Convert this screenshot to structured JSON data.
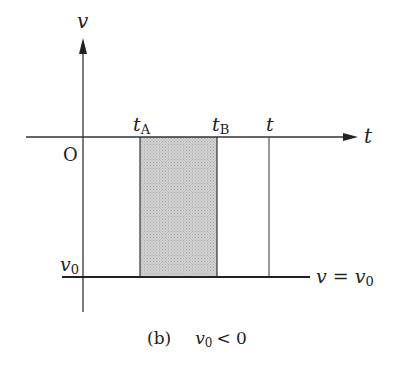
{
  "diagram": {
    "axis_labels": {
      "y": "v",
      "x": "t",
      "origin": "O"
    },
    "ticks": {
      "tA": {
        "base": "t",
        "sub": "A"
      },
      "tB": {
        "base": "t",
        "sub": "B"
      },
      "t": "t"
    },
    "v0_label": {
      "base": "v",
      "sub": "0"
    },
    "line_label": {
      "lhs": "v",
      "eq": "=",
      "rhs_base": "v",
      "rhs_sub": "0"
    },
    "caption": {
      "tag": "(b)",
      "cond_base": "v",
      "cond_sub": "0",
      "cond_rel": "< 0"
    },
    "colors": {
      "shade": "#c8c8c8",
      "line": "#333333"
    }
  }
}
